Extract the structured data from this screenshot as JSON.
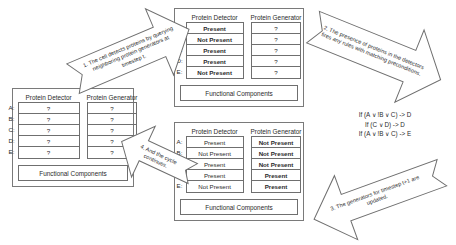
{
  "panels": {
    "left": {
      "name": "cell-state-unknown",
      "headers": [
        "Protein Detector",
        "Protein Generator"
      ],
      "row_labels": [
        "A:",
        "B:",
        "C:",
        "D:",
        "E:"
      ],
      "detector": [
        "?",
        "?",
        "?",
        "?",
        "?"
      ],
      "generator": [
        "?",
        "?",
        "?",
        "?",
        "?"
      ],
      "detector_bold": [
        false,
        false,
        false,
        false,
        false
      ],
      "generator_bold": [
        false,
        false,
        false,
        false,
        false
      ],
      "footer": "Functional Components"
    },
    "top": {
      "name": "cell-state-detected",
      "headers": [
        "Protein Detector",
        "Protein Generator"
      ],
      "row_labels": [
        "A:",
        "B:",
        "C:",
        "D:",
        "E:"
      ],
      "detector": [
        "Present",
        "Not Present",
        "Present",
        "Present",
        "Not Present"
      ],
      "generator": [
        "?",
        "?",
        "?",
        "?",
        "?"
      ],
      "detector_bold": [
        true,
        true,
        true,
        true,
        true
      ],
      "generator_bold": [
        false,
        false,
        false,
        false,
        false
      ],
      "footer": "Functional Components"
    },
    "bottom": {
      "name": "cell-state-updated",
      "headers": [
        "Protein Detector",
        "Protein Generator"
      ],
      "row_labels": [
        "A:",
        "B:",
        "C:",
        "D:",
        "E:"
      ],
      "detector": [
        "Present",
        "Not Present",
        "Present",
        "Present",
        "Not Present"
      ],
      "generator": [
        "Not Present",
        "Not Present",
        "Not Present",
        "Present",
        "Present"
      ],
      "detector_bold": [
        false,
        false,
        false,
        false,
        false
      ],
      "generator_bold": [
        true,
        true,
        true,
        true,
        true
      ],
      "footer": "Functional Components"
    }
  },
  "arrows": {
    "step1": "1. The cell detects proteins by querying neighboring protein generators at timestep t.",
    "step2": "2. The presence of proteins in the detectors fires any rules with matching preconditions.",
    "step3": "3. The generators for timestep t+1 are updated.",
    "step4": "4. And the cycle continues."
  },
  "rules": [
    "If (A ∨ !B ∨ C) -> D",
    "If (C ∨ D) -> D",
    "If (A ∨ !B ∨ C) -> E"
  ],
  "colors": {
    "stroke": "#6f6f6f",
    "text": "#2b2b2b",
    "background": "#ffffff"
  }
}
